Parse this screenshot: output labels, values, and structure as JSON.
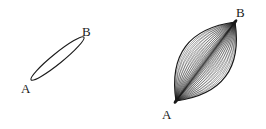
{
  "image": {
    "width": 266,
    "height": 129,
    "background_color": "#ffffff",
    "ink_color": "#1a1a1a",
    "description": "Two line-drawn geometric figures: a thin ellipse and a lens-shaped bundle of geodesic curves, each with endpoints labeled A and B."
  },
  "figures": [
    {
      "id": "thin-ellipse",
      "name": "left-figure",
      "type": "ellipse",
      "stroke_color": "#1a1a1a",
      "stroke_width": 1.1,
      "fill": "none",
      "center": {
        "x": 57.5,
        "y": 58.5
      },
      "semi_major_axis": 34.0,
      "semi_minor_axis": 5.2,
      "rotation_degrees": -39,
      "endpoints": [
        {
          "label": "A",
          "x": 31,
          "y": 75
        },
        {
          "label": "B",
          "x": 84,
          "y": 42
        }
      ],
      "labels": [
        {
          "id": "label-left-a",
          "text": "A",
          "x": 21,
          "y": 82
        },
        {
          "id": "label-left-b",
          "text": "B",
          "x": 82,
          "y": 25
        }
      ]
    },
    {
      "id": "geodesic-lens",
      "name": "right-figure",
      "type": "curve-bundle",
      "stroke_color": "#1a1a1a",
      "outline_stroke_width": 1.2,
      "inner_stroke_width": 0.45,
      "fill": "none",
      "vertex_a": {
        "x": 176,
        "y": 101
      },
      "vertex_b": {
        "x": 235,
        "y": 22
      },
      "outer_curve_bulge": 25,
      "inner_curve_count": 26,
      "endpoints": [
        {
          "label": "A",
          "x": 176,
          "y": 101
        },
        {
          "label": "B",
          "x": 235,
          "y": 22
        }
      ],
      "labels": [
        {
          "id": "label-right-a",
          "text": "A",
          "x": 162,
          "y": 108
        },
        {
          "id": "label-right-b",
          "text": "B",
          "x": 236,
          "y": 6
        }
      ]
    }
  ]
}
